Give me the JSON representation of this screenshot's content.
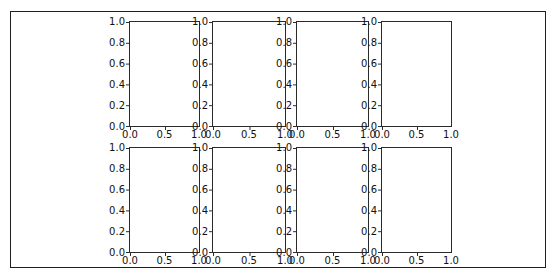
{
  "figure": {
    "background_color": "#ffffff",
    "frame_color": "#1f1f1f",
    "spine_color": "#2b2b2b",
    "text_color": "#111111"
  },
  "chart_data": {
    "type": "grid",
    "rows": 2,
    "cols": 4,
    "subplot_count": 8,
    "title": "",
    "xlabel": "",
    "ylabel": "",
    "xlim": [
      0.0,
      1.0
    ],
    "ylim": [
      0.0,
      1.0
    ],
    "xticks": [
      "0.0",
      "0.5",
      "1.0"
    ],
    "yticks": [
      "1.0",
      "0.8",
      "0.6",
      "0.4",
      "0.2",
      "0.0"
    ],
    "grid_lines": false,
    "legend": false,
    "series": [],
    "subplots": [
      {
        "row": 1,
        "col": 1,
        "data": []
      },
      {
        "row": 1,
        "col": 2,
        "data": []
      },
      {
        "row": 1,
        "col": 3,
        "data": []
      },
      {
        "row": 1,
        "col": 4,
        "data": []
      },
      {
        "row": 2,
        "col": 1,
        "data": []
      },
      {
        "row": 2,
        "col": 2,
        "data": []
      },
      {
        "row": 2,
        "col": 3,
        "data": []
      },
      {
        "row": 2,
        "col": 4,
        "data": []
      }
    ]
  }
}
